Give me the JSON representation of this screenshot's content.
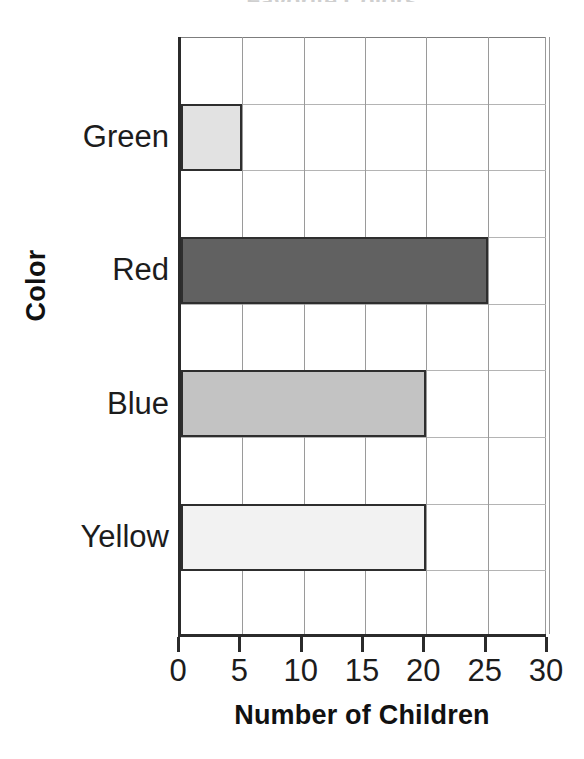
{
  "chart_data": {
    "type": "bar",
    "orientation": "horizontal",
    "title": "Favorite Colors",
    "categories": [
      "Green",
      "Red",
      "Blue",
      "Yellow"
    ],
    "values": [
      5,
      25,
      20,
      20
    ],
    "xlabel": "Number of Children",
    "ylabel": "Color",
    "xlim": [
      0,
      30
    ],
    "xticks": [
      0,
      5,
      10,
      15,
      20,
      25,
      30
    ],
    "xtick_labels": [
      "0",
      "5",
      "10",
      "15",
      "20",
      "25",
      "30"
    ],
    "grid": true,
    "legend": false,
    "bar_colors": [
      "#e2e2e2",
      "#616161",
      "#c3c3c3",
      "#f2f2f2"
    ],
    "bar_edge_color": "#2e2e2e",
    "axis_color": "#2b2b2b",
    "gridline_color": "#a8a8a8",
    "background_color": "#ffffff",
    "text_color": "#1c1c1c"
  }
}
